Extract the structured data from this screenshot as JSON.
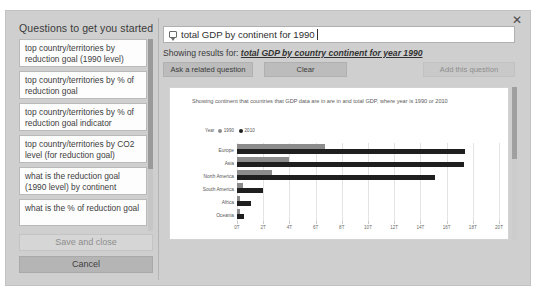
{
  "dialog": {
    "close_label": "✕"
  },
  "sidebar": {
    "title": "Questions to get you started",
    "items": [
      {
        "label": "top country/territories by reduction goal (1990 level)"
      },
      {
        "label": "top country/territories by % of reduction goal"
      },
      {
        "label": "top country/territories by % of reduction goal indicator"
      },
      {
        "label": "top country/territories by CO2 level (for reduction goal)"
      },
      {
        "label": "what is the reduction goal (1990 level) by continent"
      },
      {
        "label": "what is the % of reduction goal"
      }
    ],
    "save_label": "Save and close",
    "cancel_label": "Cancel"
  },
  "search": {
    "value": "total GDP by continent for 1990",
    "placeholder": "Ask a question about your data",
    "icon": "question-bubble-icon"
  },
  "results": {
    "prefix": "Showing results for:",
    "interpretation": "total GDP by country continent for year 1990"
  },
  "actions": {
    "related_label": "Ask a related question",
    "clear_label": "Clear",
    "add_label": "Add this question"
  },
  "chart_data": {
    "type": "bar",
    "orientation": "horizontal",
    "title": "",
    "subtitle": "Showing continent that countries that GDP data are in are in and total GDP, where year is 1990 or 2010",
    "categories": [
      "Europe",
      "Asia",
      "North America",
      "South America",
      "Africa",
      "Oceania"
    ],
    "series": [
      {
        "name": "1990",
        "color": "#8c8c8c",
        "values": [
          6.7,
          4.0,
          2.7,
          0.45,
          0.25,
          0.25
        ]
      },
      {
        "name": "2010",
        "color": "#1f1f1f",
        "values": [
          17.4,
          17.3,
          15.1,
          2.0,
          1.1,
          0.55
        ]
      }
    ],
    "legend_title": "Year",
    "legend_position": "top-left",
    "xlabel": "",
    "ylabel": "",
    "xlim": [
      0,
      20
    ],
    "xticks": [
      0,
      2,
      4,
      6,
      8,
      10,
      12,
      14,
      16,
      18,
      20
    ],
    "xtick_labels": [
      "0T",
      "2T",
      "4T",
      "6T",
      "8T",
      "10T",
      "12T",
      "14T",
      "16T",
      "18T",
      "20T"
    ],
    "grid": true
  }
}
